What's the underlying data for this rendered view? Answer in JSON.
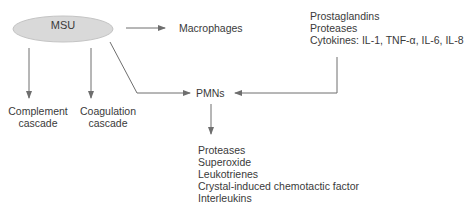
{
  "diagram": {
    "nodes": {
      "msu": "MSU",
      "macrophages": "Macrophages",
      "pmns": "PMNs",
      "complement": [
        "Complement",
        "cascade"
      ],
      "coagulation": [
        "Coagulation",
        "cascade"
      ],
      "macrophage_products": [
        "Prostaglandins",
        "Proteases",
        "Cytokines: IL-1, TNF-α, IL-6, IL-8"
      ],
      "pmn_products": [
        "Proteases",
        "Superoxide",
        "Leukotrienes",
        "Crystal-induced chemotactic factor",
        "Interleukins"
      ]
    },
    "edges": [
      {
        "from": "MSU",
        "to": "Macrophages"
      },
      {
        "from": "MSU",
        "to": "PMNs"
      },
      {
        "from": "MSU",
        "to": "Complement cascade"
      },
      {
        "from": "MSU",
        "to": "Coagulation cascade"
      },
      {
        "from": "Macrophage products",
        "to": "PMNs"
      },
      {
        "from": "PMNs",
        "to": "PMN products"
      }
    ],
    "colors": {
      "ellipse_fill": "#d9d9d9",
      "ellipse_stroke": "#bdbdbd",
      "line": "#6e6e6e",
      "text": "#3a3a3a"
    }
  }
}
